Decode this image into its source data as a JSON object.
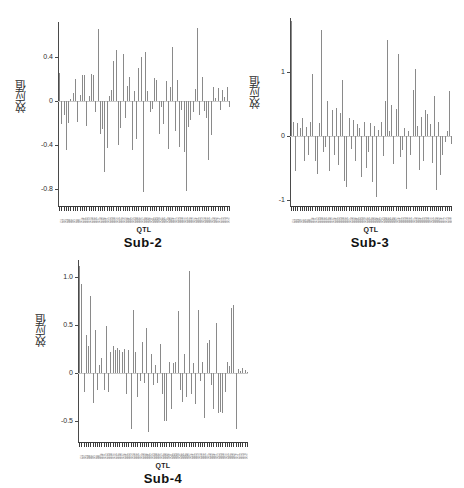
{
  "figure": {
    "background": "#ffffff",
    "bar_color": "#8a8a8a",
    "axis_color": "#3c3c3c",
    "panel_count": 3
  },
  "chart_data": [
    {
      "type": "bar",
      "title": "Sub-2",
      "xlabel": "QTL",
      "ylabel": "效应值",
      "ylim": [
        -0.95,
        0.72
      ],
      "yticks": [
        0.4,
        0,
        -0.4,
        -0.8
      ],
      "ytick_labels": [
        "0.4",
        "0",
        "-0.4",
        "-0.8"
      ],
      "grid": false,
      "legend": null,
      "n_bars": 76,
      "categories": [
        "Q1",
        "Q2",
        "Q3",
        "Q4",
        "Q5",
        "Q6",
        "Q7",
        "Q8",
        "Q9",
        "Q10",
        "Q11",
        "Q12",
        "Q13",
        "Q14",
        "Q15",
        "Q16",
        "Q17",
        "Q18",
        "Q19",
        "Q20",
        "Q21",
        "Q22",
        "Q23",
        "Q24",
        "Q25",
        "Q26",
        "Q27",
        "Q28",
        "Q29",
        "Q30",
        "Q31",
        "Q32",
        "Q33",
        "Q34",
        "Q35",
        "Q36",
        "Q37",
        "Q38",
        "Q39",
        "Q40",
        "Q41",
        "Q42",
        "Q43",
        "Q44",
        "Q45",
        "Q46",
        "Q47",
        "Q48",
        "Q49",
        "Q50",
        "Q51",
        "Q52",
        "Q53",
        "Q54",
        "Q55",
        "Q56",
        "Q57",
        "Q58",
        "Q59",
        "Q60",
        "Q61",
        "Q62",
        "Q63",
        "Q64",
        "Q65",
        "Q66",
        "Q67",
        "Q68",
        "Q69",
        "Q70",
        "Q71",
        "Q72",
        "Q73",
        "Q74",
        "Q75",
        "Q76"
      ],
      "values": [
        0.26,
        -0.21,
        -0.12,
        -0.44,
        -0.2,
        0.02,
        0.08,
        0.2,
        -0.19,
        0.06,
        0.24,
        0.24,
        -0.22,
        0.05,
        0.25,
        0.24,
        -0.1,
        0.66,
        -0.3,
        -0.25,
        -0.64,
        -0.42,
        0.05,
        0.1,
        0.37,
        0.47,
        -0.4,
        -0.24,
        0.43,
        -0.15,
        0.14,
        0.22,
        -0.44,
        0.09,
        -0.34,
        0.3,
        0.4,
        -0.82,
        0.45,
        0.09,
        -0.1,
        -0.07,
        0.21,
        0.19,
        -0.3,
        -0.05,
        -0.21,
        0.18,
        -0.43,
        0.13,
        0.49,
        -0.27,
        0.19,
        -0.41,
        -0.08,
        -0.46,
        -0.81,
        -0.23,
        -0.17,
        -0.1,
        0.11,
        0.67,
        -0.12,
        0.22,
        -0.09,
        -0.15,
        -0.53,
        -0.31,
        0.13,
        0.03,
        0.12,
        -0.08,
        0.1,
        0.04,
        0.13,
        -0.05
      ]
    },
    {
      "type": "bar",
      "title": "Sub-3",
      "xlabel": "QTL",
      "ylabel": "效应值",
      "ylim": [
        -1.1,
        1.85
      ],
      "yticks": [
        1,
        0,
        -1
      ],
      "ytick_labels": [
        "1",
        "0",
        "-1"
      ],
      "grid": false,
      "legend": null,
      "n_bars": 76,
      "categories": [
        "Q1",
        "Q2",
        "Q3",
        "Q4",
        "Q5",
        "Q6",
        "Q7",
        "Q8",
        "Q9",
        "Q10",
        "Q11",
        "Q12",
        "Q13",
        "Q14",
        "Q15",
        "Q16",
        "Q17",
        "Q18",
        "Q19",
        "Q20",
        "Q21",
        "Q22",
        "Q23",
        "Q24",
        "Q25",
        "Q26",
        "Q27",
        "Q28",
        "Q29",
        "Q30",
        "Q31",
        "Q32",
        "Q33",
        "Q34",
        "Q35",
        "Q36",
        "Q37",
        "Q38",
        "Q39",
        "Q40",
        "Q41",
        "Q42",
        "Q43",
        "Q44",
        "Q45",
        "Q46",
        "Q47",
        "Q48",
        "Q49",
        "Q50",
        "Q51",
        "Q52",
        "Q53",
        "Q54",
        "Q55",
        "Q56",
        "Q57",
        "Q58",
        "Q59",
        "Q60",
        "Q61",
        "Q62",
        "Q63",
        "Q64",
        "Q65",
        "Q66",
        "Q67",
        "Q68",
        "Q69",
        "Q70",
        "Q71",
        "Q72",
        "Q73",
        "Q74",
        "Q75",
        "Q76"
      ],
      "values": [
        1.8,
        0.22,
        -0.55,
        0.2,
        0.12,
        0.28,
        -0.4,
        0.14,
        -0.3,
        0.22,
        0.97,
        -0.4,
        -0.6,
        0.2,
        1.66,
        -0.25,
        -0.18,
        0.55,
        -0.55,
        0.4,
        -0.3,
        0.44,
        -0.45,
        0.36,
        0.88,
        -0.7,
        -0.8,
        0.28,
        -0.2,
        0.25,
        -0.4,
        0.18,
        0.12,
        -0.64,
        0.22,
        -0.5,
        -0.26,
        0.2,
        -0.72,
        0.15,
        -0.96,
        0.1,
        0.22,
        -0.32,
        0.55,
        1.5,
        0.08,
        0.48,
        -0.44,
        0.42,
        1.28,
        -0.33,
        -0.22,
        0.12,
        -0.84,
        0.08,
        -0.3,
        0.72,
        1.05,
        0.15,
        -0.53,
        0.3,
        -0.4,
        0.4,
        0.34,
        0.18,
        -0.42,
        0.62,
        -0.85,
        0.22,
        -0.62,
        -0.3,
        -0.1,
        0.08,
        0.7,
        -0.12
      ]
    },
    {
      "type": "bar",
      "title": "Sub-4",
      "xlabel": "QTL",
      "ylabel": "效应值",
      "ylim": [
        -0.72,
        1.18
      ],
      "yticks": [
        1.0,
        0.5,
        0,
        -0.5
      ],
      "ytick_labels": [
        "1.0",
        "0.5",
        "0",
        "-0.5"
      ],
      "grid": false,
      "legend": null,
      "n_bars": 76,
      "categories": [
        "Q1",
        "Q2",
        "Q3",
        "Q4",
        "Q5",
        "Q6",
        "Q7",
        "Q8",
        "Q9",
        "Q10",
        "Q11",
        "Q12",
        "Q13",
        "Q14",
        "Q15",
        "Q16",
        "Q17",
        "Q18",
        "Q19",
        "Q20",
        "Q21",
        "Q22",
        "Q23",
        "Q24",
        "Q25",
        "Q26",
        "Q27",
        "Q28",
        "Q29",
        "Q30",
        "Q31",
        "Q32",
        "Q33",
        "Q34",
        "Q35",
        "Q36",
        "Q37",
        "Q38",
        "Q39",
        "Q40",
        "Q41",
        "Q42",
        "Q43",
        "Q44",
        "Q45",
        "Q46",
        "Q47",
        "Q48",
        "Q49",
        "Q50",
        "Q51",
        "Q52",
        "Q53",
        "Q54",
        "Q55",
        "Q56",
        "Q57",
        "Q58",
        "Q59",
        "Q60",
        "Q61",
        "Q62",
        "Q63",
        "Q64",
        "Q65",
        "Q66",
        "Q67",
        "Q68",
        "Q69",
        "Q70",
        "Q71",
        "Q72",
        "Q73",
        "Q74",
        "Q75",
        "Q76"
      ],
      "values": [
        1.12,
        0.93,
        -0.2,
        0.4,
        0.28,
        0.8,
        -0.31,
        0.45,
        -0.18,
        0.08,
        0.16,
        -0.18,
        0.49,
        -0.2,
        0.22,
        0.28,
        0.24,
        0.26,
        0.24,
        0.22,
        0.25,
        -0.22,
        0.24,
        -0.58,
        0.66,
        0.22,
        -0.25,
        -0.08,
        0.32,
        -0.1,
        0.47,
        -0.62,
        0.2,
        -0.12,
        0.08,
        -0.1,
        0.3,
        -0.22,
        -0.5,
        -0.5,
        0.12,
        -0.38,
        0.1,
        0.12,
        0.65,
        -0.18,
        -0.3,
        0.2,
        -0.25,
        1.07,
        -0.22,
        0.1,
        -0.32,
        0.66,
        -0.08,
        0.12,
        -0.47,
        0.31,
        0.35,
        -0.12,
        -0.38,
        0.52,
        -0.42,
        -0.41,
        -0.42,
        -0.2,
        0.12,
        0.07,
        0.68,
        0.71,
        -0.58,
        0.04,
        0.02,
        0.05,
        0.03,
        0.01
      ]
    }
  ]
}
